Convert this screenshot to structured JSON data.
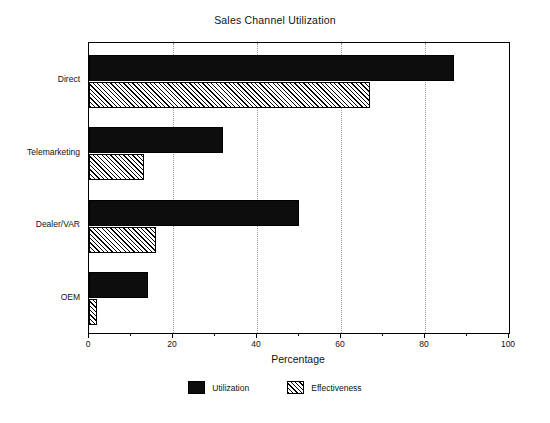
{
  "chart_data": {
    "type": "bar",
    "orientation": "horizontal",
    "title": "Sales Channel Utilization",
    "xlabel": "Percentage",
    "ylabel": "",
    "categories": [
      "Direct",
      "Telemarketing",
      "Dealer/VAR",
      "OEM"
    ],
    "series": [
      {
        "name": "Utilization",
        "values": [
          87,
          32,
          50,
          14
        ]
      },
      {
        "name": "Effectiveness",
        "values": [
          67,
          13,
          16,
          2
        ]
      }
    ],
    "xlim": [
      0,
      100
    ],
    "xticks": [
      0,
      20,
      40,
      60,
      80,
      100
    ],
    "xtick_labels": [
      "0",
      "20",
      "40",
      "60",
      "80",
      "100"
    ],
    "minor_xticks": [
      10,
      30,
      50,
      70,
      90
    ],
    "grid": "vertical-dotted-major",
    "legend_position": "bottom-center",
    "colors": {
      "utilization": "#0d0d0d",
      "effectiveness_fill": "#ffffff",
      "effectiveness_hatch": "#000000",
      "frame": "#000000",
      "gridline": "#999999",
      "background": "#ffffff"
    }
  }
}
